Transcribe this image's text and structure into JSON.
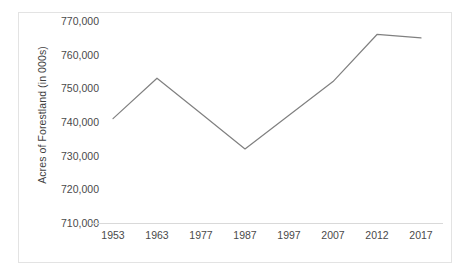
{
  "chart_data": {
    "type": "line",
    "title": "",
    "xlabel": "",
    "ylabel": "Acres of Forestland (in 000s)",
    "categories": [
      "1953",
      "1963",
      "1977",
      "1987",
      "1997",
      "2007",
      "2012",
      "2017"
    ],
    "values": [
      741000,
      753000,
      742500,
      732000,
      742000,
      752000,
      766000,
      765000
    ],
    "series": [
      {
        "name": "Acres of Forestland",
        "values": [
          741000,
          753000,
          742500,
          732000,
          742000,
          752000,
          766000,
          765000
        ],
        "color": "#808080"
      }
    ],
    "ylim": [
      710000,
      770000
    ],
    "ytick_values": [
      770000,
      760000,
      750000,
      740000,
      730000,
      720000,
      710000
    ],
    "ytick_labels": [
      "770,000",
      "760,000",
      "750,000",
      "740,000",
      "730,000",
      "720,000",
      "710,000"
    ],
    "grid": false,
    "legend": "none",
    "line_color": "#808080",
    "axis_color": "#d9d9d9",
    "border_color": "#e3e3e3",
    "text_color": "#4a4a4a"
  }
}
